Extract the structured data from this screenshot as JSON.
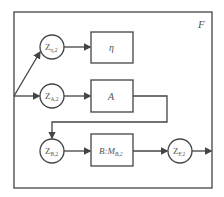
{
  "diagram": {
    "frame_label": "F",
    "nodes": {
      "z_eta": {
        "main": "Z",
        "sub": "η,2"
      },
      "z_a": {
        "main": "Z",
        "sub": "A,2"
      },
      "z_b": {
        "main": "Z",
        "sub": "B,2"
      },
      "z_f": {
        "main": "Z",
        "sub": "F,2"
      }
    },
    "boxes": {
      "eta": "η",
      "a": "A",
      "b_main": "B:M",
      "b_sub": "B,2"
    }
  },
  "colors": {
    "stroke": "#444444",
    "text": "#555555"
  }
}
